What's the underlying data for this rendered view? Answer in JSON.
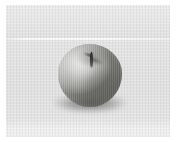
{
  "image": {
    "subject": "apple",
    "caption": "A single apple resting on a striped cloth surface",
    "color_mode": "grayscale",
    "orientation": "landscape",
    "width_px": 176,
    "height_px": 142
  },
  "scene": {
    "background": {
      "name": "striped cloth surface",
      "texture": "vertical woven stripes",
      "upper_band_label": "back cloth",
      "lower_band_label": "table cloth",
      "seam_label": "horizontal seam line",
      "foot_band_label": "pale lower band"
    },
    "subject": {
      "name": "apple",
      "shape": "round, slightly flattened",
      "stem_label": "stem in stem well",
      "highlight_label": "upper-left highlight",
      "shade_label": "lower-right shading",
      "shadow_label": "cast shadow"
    },
    "frame": {
      "margin_label": "white page margin"
    }
  },
  "colors": {
    "page_white": "#ffffff",
    "cloth_upper": "#eeeeee",
    "cloth_lower": "#e4e4e4",
    "cloth_foot": "#f2f2f2",
    "seam_white": "#ffffff",
    "apple_light": "#d6d6d4",
    "apple_mid": "#b6b6b2",
    "apple_dark": "#6e6e69",
    "stem_dark": "#2b2b28",
    "shadow_gray": "#585858"
  }
}
